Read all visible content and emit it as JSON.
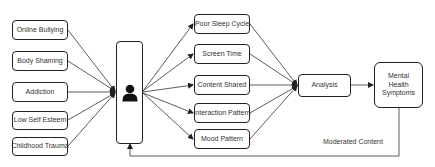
{
  "diagram": {
    "inputs": [
      {
        "label": "Online Bullying"
      },
      {
        "label": "Body Shaming"
      },
      {
        "label": "Addiction"
      },
      {
        "label": "Low Self Esteem"
      },
      {
        "label": "Childhood Trauma"
      }
    ],
    "user_node": {
      "icon": "user-icon"
    },
    "factors": [
      {
        "label": "Poor Sleep Cycle"
      },
      {
        "label": "Screen Time"
      },
      {
        "label": "Content Shared"
      },
      {
        "label": "Interaction Pattern"
      },
      {
        "label": "Mood Pattern"
      }
    ],
    "analysis": {
      "label": "Analysis"
    },
    "output": {
      "line1": "Mental",
      "line2": "Health",
      "line3": "Symptoms"
    },
    "feedback": {
      "label": "Moderated Content"
    },
    "colors": {
      "stroke": "#222222",
      "text": "#333333",
      "background": "#ffffff"
    }
  }
}
